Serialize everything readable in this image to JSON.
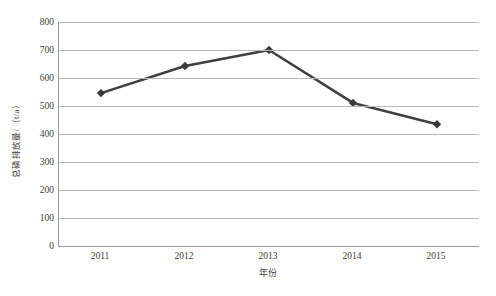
{
  "chart_data": {
    "type": "line",
    "title": "",
    "categories": [
      "2011",
      "2012",
      "2013",
      "2014",
      "2015"
    ],
    "values": [
      546,
      643,
      700,
      511,
      435
    ],
    "series": [
      {
        "name": "总磷排放量",
        "values": [
          546,
          643,
          700,
          511,
          435
        ],
        "color": "#404040",
        "marker": "diamond"
      }
    ],
    "xlabel": "年份",
    "ylabel": "总磷排放量/（t/a）",
    "ylim": [
      0,
      800
    ],
    "ytick_step": 100,
    "yticks": [
      "0",
      "100",
      "200",
      "300",
      "400",
      "500",
      "600",
      "700",
      "800"
    ],
    "grid": true,
    "grid_axis": "y",
    "legend": false,
    "legend_position": "none"
  },
  "axes": {
    "y_title": "总磷排放量/（t/a）",
    "x_title": "年份"
  },
  "colors": {
    "line": "#404040",
    "marker": "#3a3a3a",
    "gridline": "#b9b9b9",
    "axis": "#9a9a9a",
    "text": "#3d3d3d",
    "background": "#ffffff"
  }
}
